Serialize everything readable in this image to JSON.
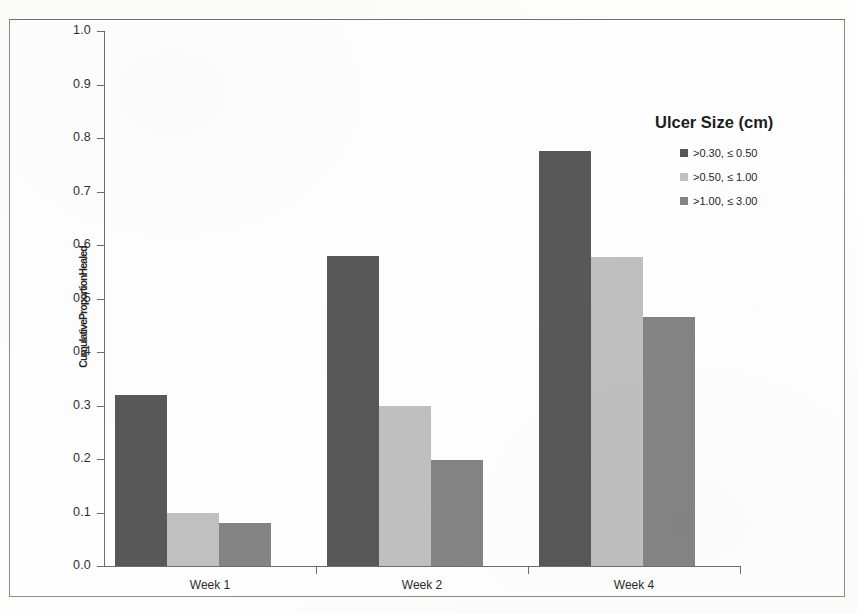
{
  "chart_data": {
    "type": "bar",
    "title": "",
    "xlabel": "",
    "ylabel": "CumulativeProportionHealed",
    "categories": [
      "Week 1",
      "Week 2",
      "Week 4"
    ],
    "ylim": [
      0.0,
      1.0
    ],
    "ytick_labels": [
      "1.0",
      "0.9",
      "0.8",
      "0.7",
      "0.6",
      "0.5",
      "0.4",
      "0.3",
      "0.2",
      "0.1",
      "0.0"
    ],
    "ytick_values": [
      1.0,
      0.9,
      0.8,
      0.7,
      0.6,
      0.5,
      0.4,
      0.3,
      0.2,
      0.1,
      0.0
    ],
    "grid": false,
    "legend_position": "right",
    "legend_title": "Ulcer Size (cm)",
    "series": [
      {
        "name": ">0.30, ≤ 0.50",
        "color": "#585858",
        "values": [
          0.32,
          0.58,
          0.775
        ]
      },
      {
        "name": ">0.50, ≤ 1.00",
        "color": "#c0c0c0",
        "values": [
          0.1,
          0.3,
          0.578
        ]
      },
      {
        "name": ">1.00, ≤ 3.00",
        "color": "#848484",
        "values": [
          0.08,
          0.198,
          0.466
        ]
      }
    ]
  },
  "legend": {
    "title": "Ulcer Size (cm)",
    "items": [
      {
        "label": ">0.30, ≤ 0.50",
        "color": "#585858"
      },
      {
        "label": ">0.50, ≤ 1.00",
        "color": "#c0c0c0"
      },
      {
        "label": ">1.00, ≤ 3.00",
        "color": "#848484"
      }
    ]
  },
  "axis": {
    "y_title": "CumulativeProportionHealed",
    "y_ticks": [
      "1.0",
      "0.9",
      "0.8",
      "0.7",
      "0.6",
      "0.5",
      "0.4",
      "0.3",
      "0.2",
      "0.1",
      "0.0"
    ],
    "x_categories": [
      "Week 1",
      "Week 2",
      "Week 4"
    ]
  },
  "colors": {
    "axis_line": "#6d6d6d",
    "frame": "#8a8a8a",
    "background": "#fefefe",
    "text": "#252525"
  }
}
